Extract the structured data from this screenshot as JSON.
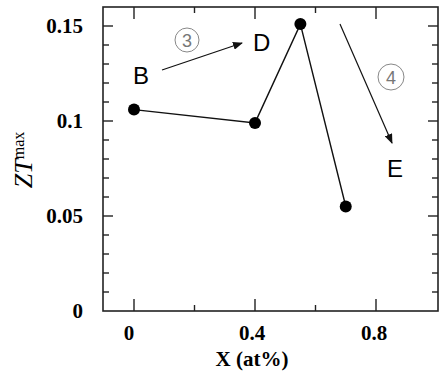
{
  "chart_data": {
    "type": "line",
    "title": "",
    "xlabel": "X (at%)",
    "ylabel": "ZT_max",
    "ylabel_main": "ZT",
    "ylabel_sub": "max",
    "xlim": [
      -0.07,
      1.0
    ],
    "ylim": [
      0,
      0.16
    ],
    "x_ticks": [
      "0",
      "0.4",
      "0.8"
    ],
    "y_ticks": [
      "0",
      "0.05",
      "0.1",
      "0.15"
    ],
    "grid": false,
    "legend": null,
    "series": [
      {
        "name": "ZT_max",
        "x": [
          0,
          0.4,
          0.55,
          0.7
        ],
        "values": [
          0.106,
          0.099,
          0.151,
          0.055
        ],
        "marker": "filled-circle",
        "color": "#000000"
      }
    ],
    "annotations": [
      {
        "text": "B",
        "type": "label"
      },
      {
        "text": "D",
        "type": "label"
      },
      {
        "text": "E",
        "type": "label"
      },
      {
        "text": "3",
        "type": "circled-number",
        "arrow": "B → D"
      },
      {
        "text": "4",
        "type": "circled-number",
        "arrow": "D → E"
      }
    ]
  }
}
